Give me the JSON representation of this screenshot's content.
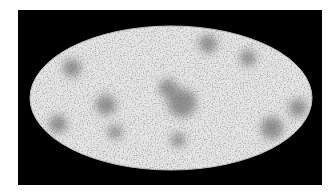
{
  "image": {
    "subject": "all-sky map (Mollweide projection)",
    "background_color": "#000000",
    "page_color": "#ffffff",
    "map_base_color": "#d9d9d9",
    "cluster_color": "#3a3a3a",
    "frame": {
      "x": 18,
      "y": 10,
      "width": 304,
      "height": 175
    },
    "ellipse": {
      "cx": 171,
      "cy": 98,
      "rx": 141,
      "ry": 72
    },
    "dark_regions": [
      {
        "x": 182,
        "y": 103,
        "r": 14
      },
      {
        "x": 168,
        "y": 88,
        "r": 9
      },
      {
        "x": 106,
        "y": 105,
        "r": 10
      },
      {
        "x": 58,
        "y": 124,
        "r": 9
      },
      {
        "x": 72,
        "y": 68,
        "r": 9
      },
      {
        "x": 208,
        "y": 44,
        "r": 9
      },
      {
        "x": 248,
        "y": 58,
        "r": 8
      },
      {
        "x": 298,
        "y": 108,
        "r": 9
      },
      {
        "x": 272,
        "y": 128,
        "r": 11
      },
      {
        "x": 115,
        "y": 132,
        "r": 7
      },
      {
        "x": 178,
        "y": 140,
        "r": 7
      }
    ]
  }
}
